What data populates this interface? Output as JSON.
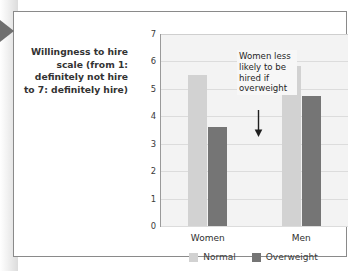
{
  "figure": {
    "axis_caption": "Willingness to hire scale (from 1: definitely not hire to 7: definitely hire)",
    "pointer_icon": "left-triangle-marker-icon"
  },
  "annotation": {
    "text": "Women less likely to be hired if overweight",
    "arrow_icon": "down-arrow-icon"
  },
  "legend": {
    "items": [
      {
        "label": "Normal",
        "color": "#d2d2d2",
        "swatch_icon": "legend-swatch-normal-icon"
      },
      {
        "label": "Overweight",
        "color": "#757575",
        "swatch_icon": "legend-swatch-overweight-icon"
      }
    ]
  },
  "chart_data": {
    "type": "bar",
    "title": "",
    "xlabel": "",
    "ylabel": "Willingness to hire scale (from 1: definitely not hire to 7: definitely hire)",
    "categories": [
      "Women",
      "Men"
    ],
    "series": [
      {
        "name": "Normal",
        "color": "#d2d2d2",
        "values": [
          5.5,
          5.85
        ]
      },
      {
        "name": "Overweight",
        "color": "#757575",
        "values": [
          3.6,
          4.75
        ]
      }
    ],
    "ylim": [
      0,
      7
    ],
    "yticks": [
      0,
      1,
      2,
      3,
      4,
      5,
      6,
      7
    ],
    "ytick_labels": [
      "0",
      "1",
      "2",
      "3",
      "4",
      "5",
      "6",
      "7"
    ],
    "grid": true,
    "grid_axis": "y",
    "legend_position": "bottom-center",
    "plot_background": "#f3f3f3",
    "annotations": [
      {
        "text": "Women less likely to be hired if overweight",
        "points_to_series": "Overweight",
        "points_to_category": "Women"
      }
    ]
  }
}
